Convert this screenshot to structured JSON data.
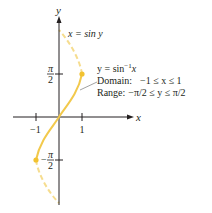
{
  "diagram": {
    "type": "function-graph",
    "colors": {
      "axis": "#231f20",
      "curve": "#f2c94c",
      "dashed_curve": "#f6dd8f",
      "point": "#f2c230",
      "text": "#231f20",
      "leader_line": "#8a8a8a"
    },
    "axes": {
      "x_label": "x",
      "y_label": "y",
      "x_ticks": [
        {
          "value": -1,
          "label": "−1"
        },
        {
          "value": 1,
          "label": "1"
        }
      ],
      "y_ticks": [
        {
          "value": "pi/2",
          "label_num": "π",
          "label_den": "2",
          "sign": ""
        },
        {
          "value": "-pi/2",
          "label_num": "π",
          "label_den": "2",
          "sign": "−"
        }
      ]
    },
    "curves": [
      {
        "name": "x = sin y",
        "style": "dashed",
        "label": "x = sin y"
      },
      {
        "name": "y = sin^-1 x",
        "style": "solid",
        "label_main": "y = sin",
        "label_sup": "−1",
        "label_var": "x"
      }
    ],
    "annotations": {
      "sin_y_label": "x = sin y",
      "arcsin_label": "y = sin⁻¹x",
      "domain_label": "Domain:",
      "domain_value": "−1 ≤ x ≤ 1",
      "range_label": "Range:",
      "range_value": "−π/2 ≤ y ≤ π/2"
    },
    "endpoints": [
      {
        "x": 1,
        "y": "pi/2"
      },
      {
        "x": -1,
        "y": "-pi/2"
      }
    ]
  }
}
